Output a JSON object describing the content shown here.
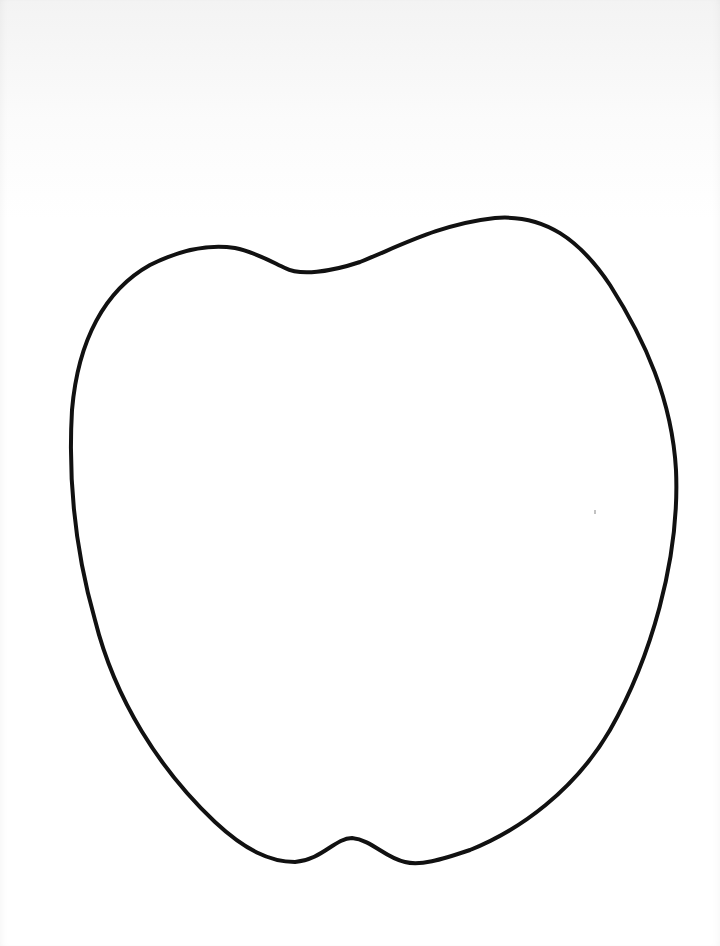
{
  "page": {
    "kind": "printable coloring template",
    "background_color": "#ffffff",
    "outline_color": "#111111",
    "outline_stroke_px": 4
  },
  "figure": {
    "shape": "apple",
    "label": ""
  }
}
